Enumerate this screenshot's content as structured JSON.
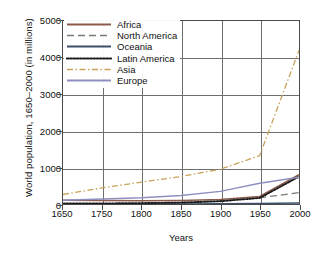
{
  "chart_data": {
    "type": "line",
    "title": "",
    "xlabel": "Years",
    "ylabel": "World population, 1650–2000 (in millions)",
    "categories": [
      "1650",
      "1750",
      "1800",
      "1850",
      "1900",
      "1950",
      "2000"
    ],
    "x_tick_labels": [
      "1650",
      "1750",
      "1800",
      "1850",
      "1900",
      "1950",
      "2000"
    ],
    "y_tick_labels": [
      "0",
      "1000",
      "2000",
      "3000",
      "4000",
      "5000"
    ],
    "y_ticks": [
      0,
      1000,
      2000,
      3000,
      4000,
      5000
    ],
    "ylim": [
      0,
      5000
    ],
    "grid": true,
    "legend_position": "top-left",
    "axis_note": "categorical x-axis: tick intervals evenly spaced although 1650–1750 spans 100 years",
    "series": [
      {
        "name": "Africa",
        "color": "#8B5A4A",
        "style": "solid",
        "values": [
          100,
          95,
          90,
          95,
          120,
          205,
          800
        ]
      },
      {
        "name": "North America",
        "color": "#7A7A70",
        "style": "long-dash",
        "values": [
          5,
          5,
          15,
          40,
          90,
          170,
          310
        ]
      },
      {
        "name": "Oceania",
        "color": "#3A5068",
        "style": "solid",
        "values": [
          2,
          2,
          2,
          2,
          6,
          13,
          30
        ]
      },
      {
        "name": "Latin America",
        "color": "#1a1a1a",
        "style": "dotted",
        "values": [
          12,
          16,
          24,
          38,
          75,
          165,
          750
        ]
      },
      {
        "name": "Asia",
        "color": "#C9A159",
        "style": "dash-dot",
        "values": [
          260,
          440,
          600,
          750,
          950,
          1320,
          4200
        ]
      },
      {
        "name": "Europe",
        "color": "#8E8FC0",
        "style": "solid",
        "values": [
          105,
          135,
          170,
          230,
          345,
          565,
          730
        ]
      }
    ]
  },
  "legend": {
    "items": [
      {
        "label": "Africa"
      },
      {
        "label": "North America"
      },
      {
        "label": "Oceania"
      },
      {
        "label": "Latin America"
      },
      {
        "label": "Asia"
      },
      {
        "label": "Europe"
      }
    ]
  }
}
